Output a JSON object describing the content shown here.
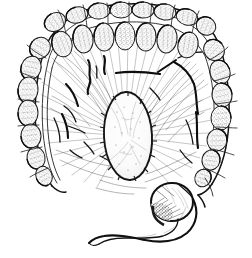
{
  "figure": {
    "title": "Large intestine (colon) anatomical engraving",
    "caption": "",
    "style": "pen-and-ink stipple engraving",
    "background_color": "#ffffff",
    "ink_color": "#1a1a1a",
    "medium": "line drawing"
  },
  "structures": [
    {
      "id": "transverse-colon",
      "label": "Transverse colon",
      "region": "top"
    },
    {
      "id": "ascending-colon",
      "label": "Ascending colon",
      "region": "right"
    },
    {
      "id": "descending-colon",
      "label": "Descending colon",
      "region": "left"
    },
    {
      "id": "haustra",
      "label": "Haustra",
      "region": "perimeter"
    },
    {
      "id": "taenia-coli",
      "label": "Taenia coli",
      "region": "perimeter"
    },
    {
      "id": "mesentery",
      "label": "Mesentery",
      "region": "center"
    },
    {
      "id": "mesenteric-vessels",
      "label": "Mesenteric vessels",
      "region": "center"
    },
    {
      "id": "central-mass",
      "label": "Central oval mass",
      "region": "center"
    },
    {
      "id": "cecum",
      "label": "Cecum",
      "region": "bottom-right"
    },
    {
      "id": "appendix",
      "label": "Vermiform appendix",
      "region": "bottom"
    }
  ],
  "haustra_upper_outer": [
    {
      "cx": 55,
      "cy": 22,
      "rx": 11,
      "ry": 9,
      "rot": -28
    },
    {
      "cx": 77,
      "cy": 15,
      "rx": 11,
      "ry": 8,
      "rot": -14
    },
    {
      "cx": 99,
      "cy": 11,
      "rx": 11,
      "ry": 8,
      "rot": -6
    },
    {
      "cx": 121,
      "cy": 10,
      "rx": 11,
      "ry": 8,
      "rot": 0
    },
    {
      "cx": 143,
      "cy": 10,
      "rx": 11,
      "ry": 8,
      "rot": 3
    },
    {
      "cx": 165,
      "cy": 12,
      "rx": 11,
      "ry": 8,
      "rot": 8
    },
    {
      "cx": 187,
      "cy": 17,
      "rx": 11,
      "ry": 8,
      "rot": 16
    },
    {
      "cx": 206,
      "cy": 26,
      "rx": 10,
      "ry": 9,
      "rot": 30
    }
  ],
  "haustra_upper_inner": [
    {
      "cx": 62,
      "cy": 44,
      "rx": 10,
      "ry": 13,
      "rot": -16
    },
    {
      "cx": 83,
      "cy": 39,
      "rx": 10,
      "ry": 14,
      "rot": -8
    },
    {
      "cx": 104,
      "cy": 37,
      "rx": 10,
      "ry": 14,
      "rot": -3
    },
    {
      "cx": 125,
      "cy": 36,
      "rx": 10,
      "ry": 14,
      "rot": 0
    },
    {
      "cx": 146,
      "cy": 37,
      "rx": 10,
      "ry": 14,
      "rot": 3
    },
    {
      "cx": 167,
      "cy": 39,
      "rx": 10,
      "ry": 14,
      "rot": 7
    },
    {
      "cx": 188,
      "cy": 45,
      "rx": 10,
      "ry": 13,
      "rot": 14
    }
  ],
  "haustra_left": [
    {
      "cx": 40,
      "cy": 48,
      "rx": 11,
      "ry": 10,
      "rot": -52
    },
    {
      "cx": 31,
      "cy": 68,
      "rx": 12,
      "ry": 10,
      "rot": -72
    },
    {
      "cx": 28,
      "cy": 90,
      "rx": 13,
      "ry": 10,
      "rot": -84
    },
    {
      "cx": 28,
      "cy": 113,
      "rx": 13,
      "ry": 10,
      "rot": -88
    },
    {
      "cx": 31,
      "cy": 136,
      "rx": 12,
      "ry": 10,
      "rot": -92
    },
    {
      "cx": 36,
      "cy": 158,
      "rx": 11,
      "ry": 9,
      "rot": -100
    },
    {
      "cx": 44,
      "cy": 176,
      "rx": 10,
      "ry": 8,
      "rot": -112
    }
  ],
  "haustra_right": [
    {
      "cx": 214,
      "cy": 50,
      "rx": 11,
      "ry": 10,
      "rot": 50
    },
    {
      "cx": 220,
      "cy": 72,
      "rx": 12,
      "ry": 10,
      "rot": 72
    },
    {
      "cx": 222,
      "cy": 95,
      "rx": 12,
      "ry": 10,
      "rot": 84
    },
    {
      "cx": 221,
      "cy": 118,
      "rx": 12,
      "ry": 10,
      "rot": 90
    },
    {
      "cx": 217,
      "cy": 140,
      "rx": 11,
      "ry": 10,
      "rot": 96
    },
    {
      "cx": 211,
      "cy": 160,
      "rx": 10,
      "ry": 9,
      "rot": 105
    },
    {
      "cx": 203,
      "cy": 178,
      "rx": 9,
      "ry": 8,
      "rot": 118
    }
  ],
  "central_mass": {
    "cx": 128,
    "cy": 136,
    "rx": 24,
    "ry": 44,
    "rotation": -3
  },
  "cecum": {
    "cx": 172,
    "cy": 202,
    "rx": 21,
    "ry": 19
  },
  "appendix": {
    "description": "long curved tapering tube from cecum to lower left",
    "length_px": 120
  }
}
